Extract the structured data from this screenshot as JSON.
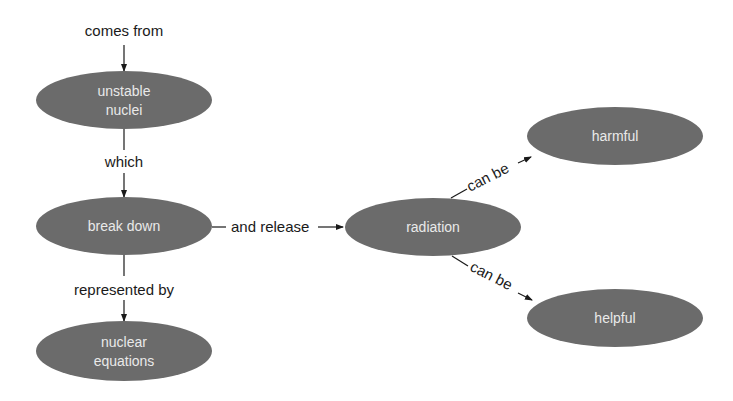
{
  "diagram": {
    "type": "concept-map",
    "colors": {
      "node_fill": "#6b6b6b",
      "node_text": "#e9e9e9",
      "line": "#1a1a1a",
      "background": "#ffffff"
    },
    "nodes": {
      "unstable_nuclei": {
        "line1": "unstable",
        "line2": "nuclei"
      },
      "break_down": {
        "label": "break down"
      },
      "nuclear_equations": {
        "line1": "nuclear",
        "line2": "equations"
      },
      "radiation": {
        "label": "radiation"
      },
      "harmful": {
        "label": "harmful"
      },
      "helpful": {
        "label": "helpful"
      }
    },
    "edges": {
      "comes_from": "comes from",
      "which": "which",
      "represented_by": "represented by",
      "and_release": "and release",
      "can_be_harmful": "can be",
      "can_be_helpful": "can be"
    }
  }
}
